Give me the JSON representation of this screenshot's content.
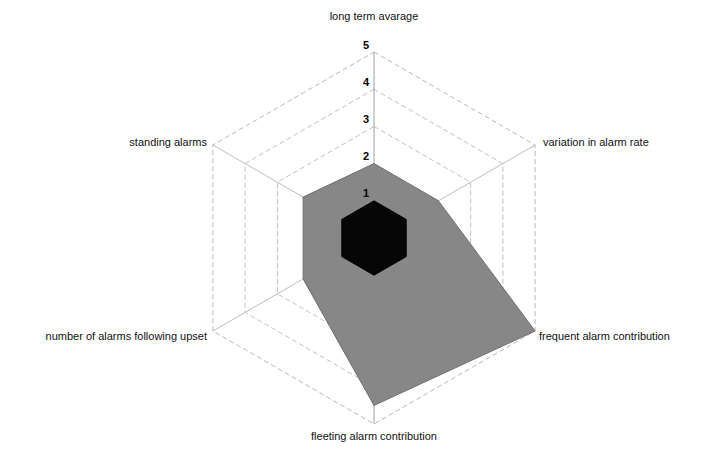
{
  "chart_data": {
    "type": "radar",
    "title": "",
    "categories": [
      "long term avarage",
      "variation in alarm rate",
      "frequent alarm contribution",
      "fleeting alarm contribution",
      "number of alarms following upset",
      "standing alarms"
    ],
    "tick_labels": [
      "1",
      "2",
      "3",
      "4",
      "5"
    ],
    "tick_values": [
      1,
      2,
      3,
      4,
      5
    ],
    "rlim": [
      0,
      5
    ],
    "grid": true,
    "legend": "none",
    "tick_axis": "long term avarage",
    "series": [
      {
        "name": "outer-assessment",
        "color": "#878787",
        "values": [
          2.0,
          2.0,
          5.0,
          4.5,
          2.2,
          2.2
        ]
      },
      {
        "name": "inner-assessment",
        "color": "#060606",
        "values": [
          1.0,
          1.0,
          1.0,
          1.0,
          1.0,
          1.0
        ]
      }
    ]
  },
  "labels": {
    "top": "long term avarage",
    "top_right": "variation in alarm rate",
    "bottom_right": "frequent alarm contribution",
    "bottom": "fleeting alarm contribution",
    "bottom_left": "number of alarms following upset",
    "top_left": "standing alarms"
  },
  "ticks": {
    "t1": "1",
    "t2": "2",
    "t3": "3",
    "t4": "4",
    "t5": "5"
  },
  "colors": {
    "series_outer": "#878787",
    "series_inner": "#060606",
    "grid": "#b5b5b5",
    "background": "#ffffff",
    "text": "#111111"
  }
}
